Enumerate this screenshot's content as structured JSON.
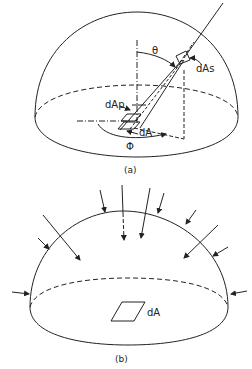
{
  "figure_a": {
    "caption": "(a)",
    "labels": {
      "theta": "θ",
      "phi": "Φ",
      "dAs": "dAs",
      "dAp": "dAp",
      "dA": "dA"
    }
  },
  "figure_b": {
    "caption": "(b)",
    "labels": {
      "dA": "dA"
    }
  },
  "colors": {
    "stroke": "#222222",
    "background": "#ffffff"
  }
}
